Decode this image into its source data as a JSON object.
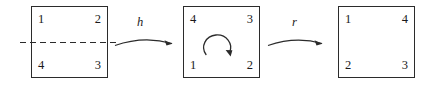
{
  "figure": {
    "background_color": "#ffffff",
    "stroke_color": "#2b2b2b",
    "text_color": "#1a1a1a"
  },
  "squares": [
    {
      "id": "square-1",
      "name": "initial-square",
      "corners": {
        "top_left": "1",
        "top_right": "2",
        "bottom_left": "4",
        "bottom_right": "3"
      },
      "has_dashed_axis": true,
      "has_rotation_arrow": false
    },
    {
      "id": "square-2",
      "name": "reflected-square",
      "corners": {
        "top_left": "4",
        "top_right": "3",
        "bottom_left": "1",
        "bottom_right": "2"
      },
      "has_dashed_axis": false,
      "has_rotation_arrow": true
    },
    {
      "id": "square-3",
      "name": "rotated-square",
      "corners": {
        "top_left": "1",
        "top_right": "4",
        "bottom_left": "2",
        "bottom_right": "3"
      },
      "has_dashed_axis": false,
      "has_rotation_arrow": false
    }
  ],
  "arrows": [
    {
      "id": "arrow-h",
      "label": "h",
      "from": "square-1",
      "to": "square-2"
    },
    {
      "id": "arrow-r",
      "label": "r",
      "from": "square-2",
      "to": "square-3"
    }
  ],
  "annotations": {
    "dashed_axis_name": "horizontal-reflection-axis",
    "rotation_arrow_name": "clockwise-rotation-arrow"
  }
}
